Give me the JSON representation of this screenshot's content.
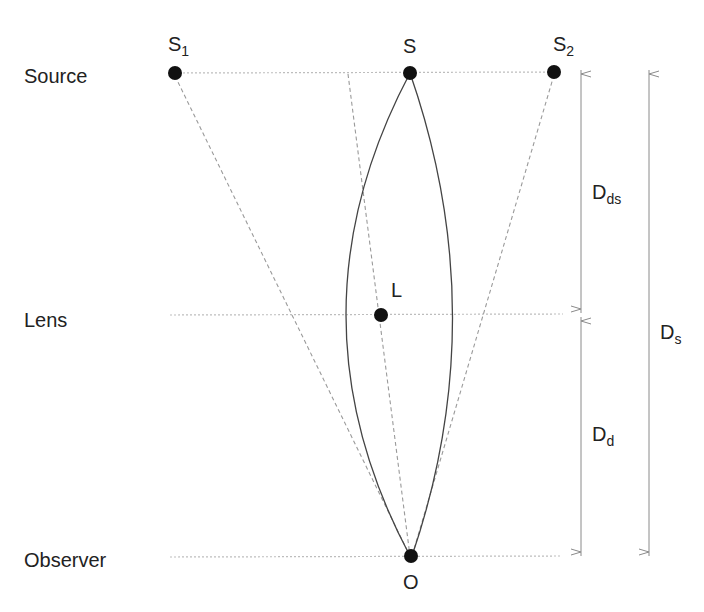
{
  "diagram": {
    "type": "gravitational-lensing-geometry",
    "row_labels": {
      "source": "Source",
      "lens": "Lens",
      "observer": "Observer"
    },
    "points": {
      "S1": {
        "main": "S",
        "sub": "1"
      },
      "S": {
        "main": "S",
        "sub": ""
      },
      "S2": {
        "main": "S",
        "sub": "2"
      },
      "L": {
        "main": "L",
        "sub": ""
      },
      "O": {
        "main": "O",
        "sub": ""
      }
    },
    "distances": {
      "Dds": {
        "main": "D",
        "sub": "ds"
      },
      "Dd": {
        "main": "D",
        "sub": "d"
      },
      "Ds": {
        "main": "D",
        "sub": "s"
      }
    },
    "colors": {
      "points": "#111111",
      "solid_rays": "#444444",
      "dashed_rays": "#9a9a9a",
      "dotted_guides": "#bdbdbd",
      "arrows": "#8a8a8a"
    }
  }
}
